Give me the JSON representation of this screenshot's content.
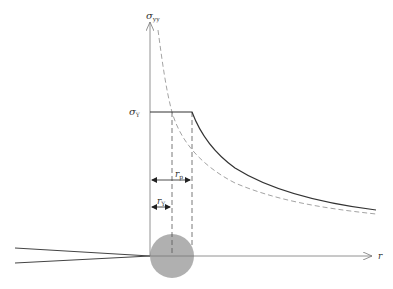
{
  "diagram": {
    "labels": {
      "y_axis": "σ",
      "y_axis_sub": "yy",
      "yield": "σ",
      "yield_sub": "Y",
      "x_axis": "r",
      "rp": "r",
      "rp_sub": "p",
      "ry": "r",
      "ry_sub": "Y"
    },
    "colors": {
      "axis": "#777777",
      "curve_solid": "#333333",
      "curve_dashed": "#999999",
      "plastic_zone": "#b0b0b0",
      "crack": "#444444"
    }
  }
}
